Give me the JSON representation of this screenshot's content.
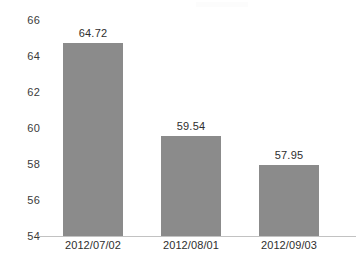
{
  "chart_data": {
    "type": "bar",
    "title": "",
    "subtitle": "",
    "xlabel": "",
    "ylabel": "",
    "categories": [
      "2012/07/02",
      "2012/08/01",
      "2012/09/03"
    ],
    "values": [
      64.72,
      59.54,
      57.95
    ],
    "value_labels": [
      "64.72",
      "59.54",
      "57.95"
    ],
    "ylim": [
      54,
      66
    ],
    "ytick_step": 2,
    "ytick_labels": [
      "66",
      "64",
      "62",
      "60",
      "58",
      "56",
      "54"
    ],
    "ytick_values": [
      66,
      64,
      62,
      60,
      58,
      56,
      54
    ],
    "grid": false,
    "legend": false,
    "legend_position": "none",
    "orientation": "vertical",
    "series": [
      {
        "name": "",
        "values": [
          64.72,
          59.54,
          57.95
        ]
      }
    ]
  },
  "style": {
    "bar_color": "#8b8b8b",
    "axis_line_color": "#c2c2c2",
    "text_color": "#2e2e2e",
    "tick_text_color": "#3a3a3a",
    "background": "#ffffff"
  }
}
